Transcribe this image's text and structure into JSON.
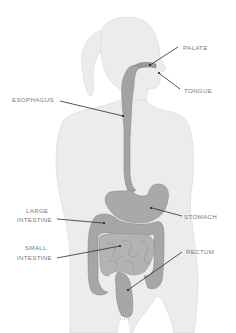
{
  "diagram": {
    "colors": {
      "background": "#ffffff",
      "body": "#ececec",
      "body_outline": "#d6d6d6",
      "organ": "#a9a9a9",
      "organ_dark": "#8f8f8f",
      "organ_outline": "#7d7d7d",
      "label_text": "#7a7a7a",
      "leader_line": "#2c2c2c"
    },
    "labels": {
      "palate": "PALATE",
      "tongue": "TONGUE",
      "esophagus": "ESOPHAGUS",
      "large_intestine_1": "LARGE",
      "large_intestine_2": "INTESTINE",
      "small_intestine_1": "SMALL",
      "small_intestine_2": "INTESTINE",
      "stomach": "STOMACH",
      "rectum": "RECTUM"
    }
  }
}
